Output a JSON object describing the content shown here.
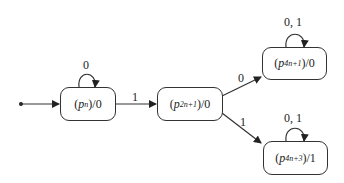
{
  "diagram": {
    "type": "state-machine",
    "states": [
      {
        "id": "pn",
        "prefix": "(",
        "symbol": "p",
        "subscript": "n",
        "suffix": ")/0",
        "output": "0",
        "initial": true,
        "self_loop_label": "0"
      },
      {
        "id": "p2n1",
        "prefix": "(",
        "symbol": "p",
        "subscript": "2n+1",
        "suffix": ")/0",
        "output": "0",
        "initial": false
      },
      {
        "id": "p4n1",
        "prefix": "(",
        "symbol": "p",
        "subscript": "4n+1",
        "suffix": ")/0",
        "output": "0",
        "initial": false,
        "self_loop_label": "0, 1"
      },
      {
        "id": "p4n3",
        "prefix": "(",
        "symbol": "p",
        "subscript": "4n+3",
        "suffix": ")/1",
        "output": "1",
        "initial": false,
        "self_loop_label": "0, 1"
      }
    ],
    "transitions": [
      {
        "from": "pn",
        "to": "pn",
        "label": "0"
      },
      {
        "from": "pn",
        "to": "p2n1",
        "label": "1"
      },
      {
        "from": "p2n1",
        "to": "p4n1",
        "label": "0"
      },
      {
        "from": "p2n1",
        "to": "p4n3",
        "label": "1"
      },
      {
        "from": "p4n1",
        "to": "p4n1",
        "label": "0, 1"
      },
      {
        "from": "p4n3",
        "to": "p4n3",
        "label": "0, 1"
      }
    ]
  }
}
